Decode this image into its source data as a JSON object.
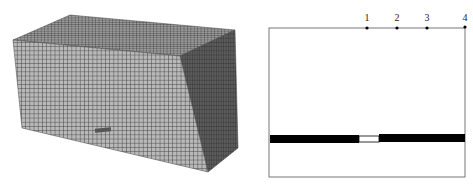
{
  "figure": {
    "left_panel": {
      "description": "3D finite element mesh of rectangular block",
      "mesh_color": "#8a8a8a",
      "line_color": "#3a3a3a"
    },
    "right_panel": {
      "description": "Cross-section schematic with measurement points",
      "points": [
        {
          "label": "1",
          "x": 107
        },
        {
          "label": "2",
          "x": 137
        },
        {
          "label": "3",
          "x": 167
        },
        {
          "label": "4",
          "x": 205
        }
      ],
      "bar_color": "#000000"
    }
  }
}
